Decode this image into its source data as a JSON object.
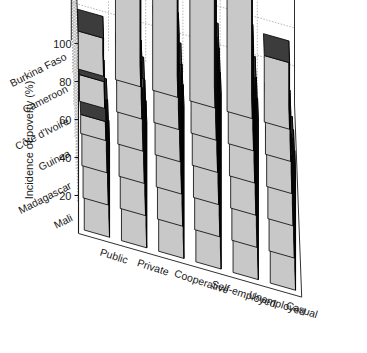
{
  "chart_data": {
    "type": "bar",
    "title": "",
    "subtitle": "",
    "xlabel": "",
    "ylabel": "Incidence of poverty (%)",
    "zlabel": "",
    "ylim": [
      0,
      100
    ],
    "yticks": [
      20,
      40,
      60,
      80,
      100
    ],
    "ytick_labels": [
      "20",
      "40",
      "60",
      "80",
      "100"
    ],
    "grid": true,
    "legend": false,
    "legend_position": "none",
    "projection": "3d",
    "categories": [
      "Public",
      "Private",
      "Cooperative",
      "Self-employed",
      "Unemployed",
      "Casual"
    ],
    "rows": [
      "Burkina Faso",
      "Cameroon",
      "Côte d'Ivoire",
      "Guinea",
      "Madagascar",
      "Mali"
    ],
    "series": [
      {
        "name": "Burkina Faso",
        "values": [
          20,
          46,
          62,
          90,
          72,
          35
        ]
      },
      {
        "name": "Cameroon",
        "values": [
          14,
          30,
          50,
          80,
          55,
          26
        ]
      },
      {
        "name": "Côte d'Ivoire",
        "values": [
          10,
          22,
          40,
          60,
          44,
          20
        ]
      },
      {
        "name": "Guinea",
        "values": [
          38,
          55,
          68,
          84,
          72,
          46
        ]
      },
      {
        "name": "Madagascar",
        "values": [
          44,
          60,
          74,
          88,
          78,
          56
        ]
      },
      {
        "name": "Mali",
        "values": [
          50,
          66,
          80,
          92,
          84,
          62
        ]
      }
    ],
    "colors": {
      "bar_front": "#c8c8c8",
      "bar_top": "#3c3c3c",
      "bar_side": "#000000",
      "axis": "#1a1a1a",
      "grid": "#9a9a9a",
      "background": "#ffffff"
    }
  }
}
